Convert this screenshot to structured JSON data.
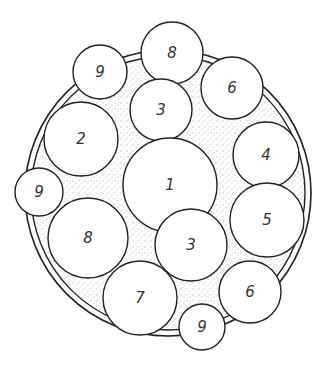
{
  "diagram": {
    "outer_ring": {
      "cx": 168,
      "cy": 193,
      "r_outer": 143,
      "r_inner": 137
    },
    "stipple_color": "#555555",
    "stroke_color": "#222222",
    "circles": [
      {
        "label": "8",
        "cx": 172,
        "cy": 53,
        "r": 31
      },
      {
        "label": "9",
        "cx": 100,
        "cy": 72,
        "r": 27
      },
      {
        "label": "6",
        "cx": 232,
        "cy": 88,
        "r": 31
      },
      {
        "label": "3",
        "cx": 161,
        "cy": 110,
        "r": 31
      },
      {
        "label": "2",
        "cx": 81,
        "cy": 139,
        "r": 37
      },
      {
        "label": "4",
        "cx": 266,
        "cy": 155,
        "r": 33
      },
      {
        "label": "1",
        "cx": 170,
        "cy": 185,
        "r": 47
      },
      {
        "label": "9",
        "cx": 39,
        "cy": 192,
        "r": 24
      },
      {
        "label": "5",
        "cx": 267,
        "cy": 220,
        "r": 37
      },
      {
        "label": "8",
        "cx": 88,
        "cy": 238,
        "r": 40
      },
      {
        "label": "3",
        "cx": 191,
        "cy": 245,
        "r": 36
      },
      {
        "label": "7",
        "cx": 140,
        "cy": 298,
        "r": 37
      },
      {
        "label": "6",
        "cx": 250,
        "cy": 292,
        "r": 31
      },
      {
        "label": "9",
        "cx": 202,
        "cy": 327,
        "r": 23
      }
    ]
  }
}
